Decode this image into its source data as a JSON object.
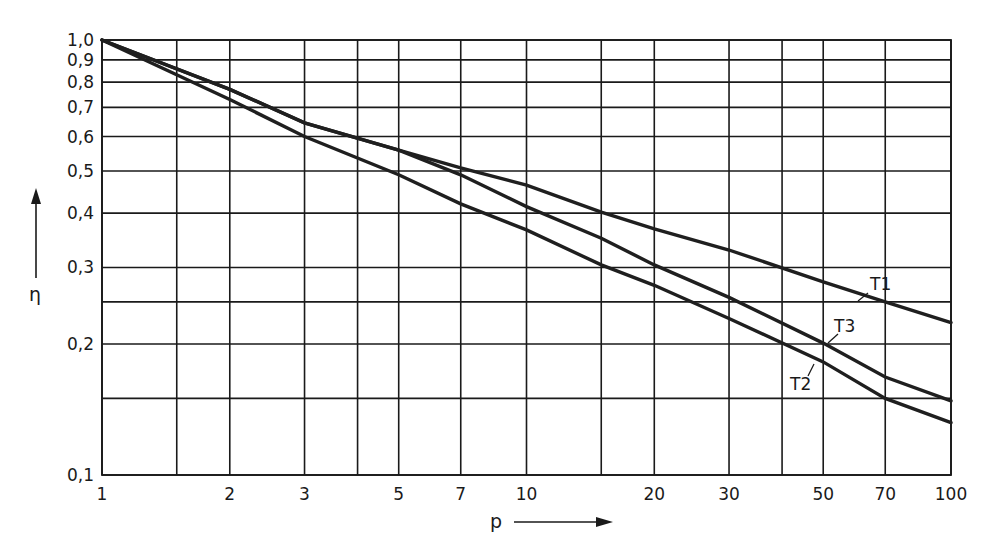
{
  "chart_data": {
    "type": "line",
    "title": "",
    "xlabel": "p",
    "ylabel": "η",
    "xscale": "log",
    "yscale": "log",
    "xlim": [
      1,
      100
    ],
    "ylim": [
      0.1,
      1.0
    ],
    "grid": true,
    "legend": "inline labels at line ends",
    "x_ticks": [
      1,
      2,
      3,
      5,
      7,
      10,
      20,
      30,
      50,
      70,
      100
    ],
    "x_tick_labels": [
      "1",
      "2",
      "3",
      "5",
      "7",
      "10",
      "20",
      "30",
      "50",
      "70",
      "100"
    ],
    "x_gridlines": [
      1,
      1.5,
      2,
      3,
      4,
      5,
      7,
      10,
      15,
      20,
      30,
      40,
      50,
      70,
      100
    ],
    "y_ticks": [
      0.1,
      0.2,
      0.3,
      0.4,
      0.5,
      0.6,
      0.7,
      0.8,
      0.9,
      1.0
    ],
    "y_tick_labels": [
      "0,1",
      "0,2",
      "0,3",
      "0,4",
      "0,5",
      "0,6",
      "0,7",
      "0,8",
      "0,9",
      "1,0"
    ],
    "y_gridlines": [
      0.1,
      0.15,
      0.2,
      0.25,
      0.3,
      0.4,
      0.5,
      0.6,
      0.7,
      0.8,
      0.9,
      1.0
    ],
    "x": [
      1,
      2,
      3,
      5,
      7,
      10,
      15,
      20,
      30,
      50,
      70,
      100
    ],
    "series": [
      {
        "name": "T1",
        "values": [
          1.0,
          0.77,
          0.645,
          0.558,
          0.508,
          0.464,
          0.402,
          0.368,
          0.329,
          0.278,
          0.25,
          0.224
        ]
      },
      {
        "name": "T2",
        "values": [
          1.0,
          0.73,
          0.6,
          0.49,
          0.42,
          0.366,
          0.304,
          0.273,
          0.229,
          0.182,
          0.15,
          0.132
        ]
      },
      {
        "name": "T3",
        "values": [
          1.0,
          0.77,
          0.645,
          0.558,
          0.49,
          0.414,
          0.35,
          0.304,
          0.256,
          0.201,
          0.168,
          0.148
        ]
      }
    ],
    "annotations": [
      {
        "text": "T1",
        "x": 70,
        "y": 0.27
      },
      {
        "text": "T3",
        "x": 55,
        "y": 0.215
      },
      {
        "text": "T2",
        "x": 45,
        "y": 0.165
      }
    ]
  }
}
